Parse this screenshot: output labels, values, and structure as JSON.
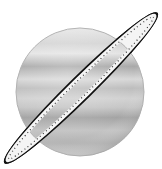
{
  "image": {
    "subject": "planet-with-ring",
    "icon": "saturn-icon",
    "colors": {
      "background": "#ffffff",
      "planet_light": "#e6e6e6",
      "planet_mid": "#b8b8b8",
      "planet_dark": "#8f8f8f",
      "ring_outline": "#111111",
      "ring_fill": "#f4f4f4",
      "ring_dots": "#333333"
    }
  }
}
